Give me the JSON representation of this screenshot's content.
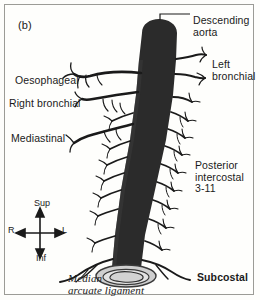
{
  "figure": {
    "panel_letter": "(b)",
    "background_color": "#fefefc",
    "border_color": "#9b9b96",
    "vessel_color": "#2b2b2b",
    "ink_color": "#1a1a1a"
  },
  "labels": {
    "descending_aorta": "Descending\naorta",
    "left_bronchial": "Left\nbronchial",
    "oesophageal": "Oesophageal",
    "right_bronchial": "Right bronchial",
    "mediastinal": "Mediastinal",
    "posterior_intercostal": "Posterior\nintercostal\n3-11",
    "subcostal": "Subcostal",
    "median_arcuate_ligament": "Median\narcuate ligament"
  },
  "orientation_compass": {
    "superior": "Sup",
    "inferior": "Inf",
    "right": "R",
    "left": "L"
  }
}
